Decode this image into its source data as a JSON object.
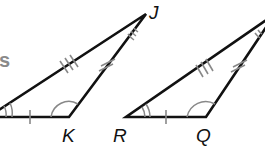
{
  "diagram": {
    "colors": {
      "stroke": "#111111",
      "marks": "#888888",
      "fragment_text": "#8a8a8a"
    },
    "fragment_text": "s",
    "triangle_left": {
      "vertices": {
        "bottom_left": "",
        "bottom_right": "K",
        "apex": "J"
      },
      "labels": {
        "K": "K",
        "J": "J"
      },
      "marks": {
        "base": "single tick",
        "long_side": "triple tick",
        "short_side": "double tick",
        "angle_bottom_left": "double arc",
        "angle_K": "single arc",
        "angle_J": "triple arc"
      }
    },
    "triangle_right": {
      "vertices": {
        "bottom_left": "R",
        "bottom_right": "Q",
        "apex": ""
      },
      "labels": {
        "R": "R",
        "Q": "Q"
      },
      "marks": {
        "base": "single tick",
        "long_side": "triple tick",
        "short_side": "double tick",
        "angle_R": "double arc",
        "angle_Q": "single arc",
        "angle_apex": "triple arc"
      }
    }
  }
}
